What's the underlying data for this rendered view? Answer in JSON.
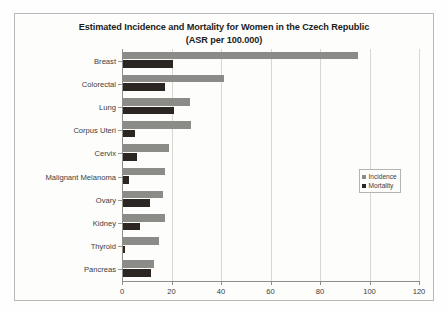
{
  "chart_data": {
    "type": "bar",
    "orientation": "horizontal",
    "title": "Estimated Incidence and  Mortality for Women in the Czech Republic",
    "subtitle": "(ASR per 100.000)",
    "xlabel": "",
    "ylabel": "",
    "xlim": [
      0,
      120
    ],
    "xticks": [
      "0",
      "20",
      "40",
      "60",
      "80",
      "100",
      "120"
    ],
    "grid": true,
    "legend_position": "right",
    "categories": [
      "Breast",
      "Colorectal",
      "Lung",
      "Corpus Uteri",
      "Cervix",
      "Malignant Melanoma",
      "Ovary",
      "Kidney",
      "Thyroid",
      "Pancreas"
    ],
    "series": [
      {
        "name": "Incidence",
        "color": "#8b8b88",
        "values": [
          95.0,
          41.0,
          27.0,
          27.5,
          18.5,
          17.0,
          16.0,
          17.0,
          14.5,
          12.5
        ]
      },
      {
        "name": "Mortality",
        "color": "#2c2622",
        "values": [
          20.0,
          17.0,
          20.5,
          5.0,
          5.5,
          2.5,
          11.0,
          7.0,
          1.0,
          11.5
        ]
      }
    ]
  },
  "legend": {
    "items": [
      {
        "label": "Incidence"
      },
      {
        "label": "Mortality"
      }
    ]
  }
}
